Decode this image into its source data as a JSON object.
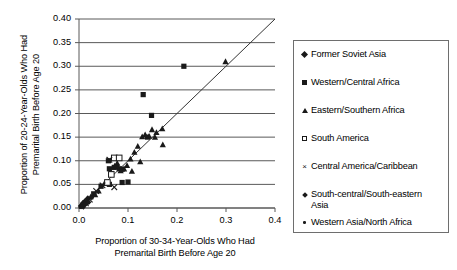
{
  "chart_data": {
    "type": "scatter",
    "title": "",
    "xlabel": "Proportion of 30-34-Year-Olds Who Had\nPremarital Birth Before Age 20",
    "ylabel": "Proportion of 20-24-Year-Olds Who Had\nPremarital Birth Before Age 20",
    "xlim": [
      0.0,
      0.4
    ],
    "ylim": [
      0.0,
      0.4
    ],
    "xticks": [
      "0.0",
      "0.1",
      "0.2",
      "0.3",
      "0.4"
    ],
    "xtick_values": [
      0.0,
      0.1,
      0.2,
      0.3,
      0.4
    ],
    "yticks": [
      "0.00",
      "0.05",
      "0.10",
      "0.15",
      "0.20",
      "0.25",
      "0.30",
      "0.35",
      "0.40"
    ],
    "ytick_values": [
      0.0,
      0.05,
      0.1,
      0.15,
      0.2,
      0.25,
      0.3,
      0.35,
      0.4
    ],
    "grid": "horizontal",
    "legend_position": "right-outside",
    "reference_line": {
      "label": "y = x",
      "from": [
        0.0,
        0.0
      ],
      "to": [
        0.4,
        0.4
      ]
    },
    "series": [
      {
        "name": "Former Soviet Asia",
        "marker": "filled-diamond",
        "color": "#1a1a1a",
        "points": [
          [
            0.004,
            0.004
          ],
          [
            0.006,
            0.006
          ],
          [
            0.008,
            0.01
          ],
          [
            0.01,
            0.008
          ],
          [
            0.012,
            0.014
          ],
          [
            0.014,
            0.012
          ],
          [
            0.018,
            0.02
          ]
        ]
      },
      {
        "name": "Western/Central Africa",
        "marker": "filled-square",
        "color": "#1a1a1a",
        "points": [
          [
            0.06,
            0.1
          ],
          [
            0.062,
            0.083
          ],
          [
            0.066,
            0.073
          ],
          [
            0.072,
            0.086
          ],
          [
            0.077,
            0.088
          ],
          [
            0.082,
            0.083
          ],
          [
            0.088,
            0.082
          ],
          [
            0.062,
            0.05
          ],
          [
            0.088,
            0.054
          ],
          [
            0.1,
            0.055
          ],
          [
            0.131,
            0.24
          ],
          [
            0.148,
            0.196
          ],
          [
            0.214,
            0.3
          ],
          [
            0.14,
            0.15
          ],
          [
            0.03,
            0.03
          ],
          [
            0.045,
            0.046
          ]
        ]
      },
      {
        "name": "Eastern/Southern Africa",
        "marker": "filled-triangle",
        "color": "#1a1a1a",
        "points": [
          [
            0.299,
            0.31
          ],
          [
            0.17,
            0.168
          ],
          [
            0.158,
            0.16
          ],
          [
            0.155,
            0.15
          ],
          [
            0.149,
            0.166
          ],
          [
            0.143,
            0.152
          ],
          [
            0.135,
            0.155
          ],
          [
            0.129,
            0.151
          ],
          [
            0.12,
            0.131
          ],
          [
            0.113,
            0.118
          ],
          [
            0.105,
            0.104
          ],
          [
            0.098,
            0.09
          ],
          [
            0.092,
            0.083
          ],
          [
            0.085,
            0.079
          ],
          [
            0.078,
            0.095
          ],
          [
            0.073,
            0.089
          ],
          [
            0.171,
            0.134
          ],
          [
            0.125,
            0.098
          ],
          [
            0.108,
            0.078
          ],
          [
            0.052,
            0.052
          ],
          [
            0.04,
            0.036
          ],
          [
            0.033,
            0.028
          ],
          [
            0.024,
            0.024
          ],
          [
            0.016,
            0.014
          ]
        ]
      },
      {
        "name": "South America",
        "marker": "open-square",
        "color": "#1a1a1a",
        "points": [
          [
            0.072,
            0.106
          ],
          [
            0.082,
            0.106
          ],
          [
            0.066,
            0.071
          ],
          [
            0.058,
            0.054
          ]
        ]
      },
      {
        "name": "Central America/Caribbean",
        "marker": "cross",
        "color": "#1a1a1a",
        "points": [
          [
            0.062,
            0.102
          ],
          [
            0.072,
            0.044
          ],
          [
            0.048,
            0.048
          ],
          [
            0.035,
            0.036
          ],
          [
            0.022,
            0.018
          ],
          [
            0.014,
            0.01
          ]
        ]
      },
      {
        "name": "South-central/South-eastern Asia",
        "marker": "small-diamond",
        "color": "#1a1a1a",
        "points": [
          [
            0.006,
            0.003
          ],
          [
            0.01,
            0.006
          ],
          [
            0.014,
            0.008
          ],
          [
            0.02,
            0.012
          ],
          [
            0.026,
            0.022
          ],
          [
            0.009,
            0.002
          ]
        ]
      },
      {
        "name": "Western Asia/North Africa",
        "marker": "dot",
        "color": "#1a1a1a",
        "points": [
          [
            0.002,
            0.001
          ],
          [
            0.004,
            0.002
          ],
          [
            0.006,
            0.004
          ],
          [
            0.008,
            0.003
          ],
          [
            0.011,
            0.005
          ],
          [
            0.016,
            0.009
          ]
        ]
      }
    ]
  },
  "legend": {
    "entries": [
      {
        "label": "Former Soviet Asia",
        "marker": "filled-diamond"
      },
      {
        "label": "Western/Central Africa",
        "marker": "filled-square"
      },
      {
        "label": "Eastern/Southern Africa",
        "marker": "filled-triangle"
      },
      {
        "label": "South America",
        "marker": "open-square"
      },
      {
        "label": "Central America/Caribbean",
        "marker": "cross"
      },
      {
        "label": "South-central/South-eastern\nAsia",
        "marker": "small-diamond"
      },
      {
        "label": "Western Asia/North Africa",
        "marker": "dot"
      }
    ]
  },
  "colors": {
    "marker": "#1a1a1a",
    "grid": "#595959",
    "axis": "#595959",
    "legend_border": "#6e6e6e",
    "background": "#ffffff"
  }
}
